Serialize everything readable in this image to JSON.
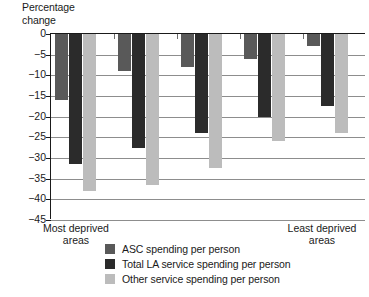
{
  "chart_data": {
    "type": "bar",
    "title": "",
    "ylabel": "Percentage\nchange",
    "xlabel": "",
    "ylim": [
      -45,
      0
    ],
    "yticks": [
      0,
      -5,
      -10,
      -15,
      -20,
      -25,
      -30,
      -35,
      -40,
      -45
    ],
    "ytick_labels": [
      "0",
      "−5",
      "−10",
      "−15",
      "−20",
      "−25",
      "−30",
      "−35",
      "−40",
      "−45"
    ],
    "grid": true,
    "legend_position": "bottom",
    "categories": [
      "1",
      "2",
      "3",
      "4",
      "5"
    ],
    "category_axis_labels": {
      "first": "Most deprived\nareas",
      "last": "Least deprived\nareas"
    },
    "series": [
      {
        "name": "ASC spending per person",
        "color": "#595959",
        "values": [
          -16.0,
          -9.0,
          -8.0,
          -6.0,
          -3.0
        ]
      },
      {
        "name": "Total LA service spending per person",
        "color": "#2b2b2b",
        "values": [
          -31.5,
          -27.5,
          -24.0,
          -20.0,
          -17.5
        ]
      },
      {
        "name": "Other service spending per person",
        "color": "#bcbcbc",
        "values": [
          -38.0,
          -36.5,
          -32.5,
          -26.0,
          -24.0
        ]
      }
    ]
  }
}
